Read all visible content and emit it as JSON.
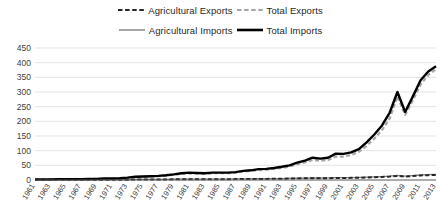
{
  "legend": {
    "rows": [
      [
        {
          "label": "Agricultural Exports",
          "color": "#262626",
          "style": "dashed",
          "width": 2.2,
          "icon": "dashed-line-icon"
        },
        {
          "label": "Total Exports",
          "color": "#a6a6a6",
          "style": "dashed",
          "width": 2.2,
          "icon": "dashed-line-icon"
        }
      ],
      [
        {
          "label": "Agricultural Imports",
          "color": "#808080",
          "style": "solid",
          "width": 1.4,
          "icon": "solid-line-icon"
        },
        {
          "label": "Total Imports",
          "color": "#000000",
          "style": "solid",
          "width": 2.6,
          "icon": "solid-line-icon"
        }
      ]
    ]
  },
  "chart_data": {
    "type": "line",
    "title": "",
    "subtitle": "",
    "xlabel": "",
    "ylabel": "",
    "ylim": [
      0,
      450
    ],
    "ytick_step": 50,
    "yticks": [
      0,
      50,
      100,
      150,
      200,
      250,
      300,
      350,
      400,
      450
    ],
    "ytick_labels": [
      "0",
      "50",
      "100",
      "150",
      "200",
      "250",
      "300",
      "350",
      "400",
      "450"
    ],
    "grid": true,
    "grid_axis": "y",
    "legend_position": "top",
    "x_start": 1961,
    "x_end": 2013,
    "xtick_step": 2,
    "xticks": [
      1961,
      1963,
      1965,
      1967,
      1969,
      1971,
      1973,
      1975,
      1977,
      1979,
      1981,
      1983,
      1985,
      1987,
      1989,
      1991,
      1993,
      1995,
      1997,
      1999,
      2001,
      2003,
      2005,
      2007,
      2009,
      2011,
      2013
    ],
    "xtick_labels": [
      "1961",
      "1963",
      "1965",
      "1967",
      "1969",
      "1971",
      "1973",
      "1975",
      "1977",
      "1979",
      "1981",
      "1983",
      "1985",
      "1987",
      "1989",
      "1991",
      "1993",
      "1995",
      "1997",
      "1999",
      "2001",
      "2003",
      "2005",
      "2007",
      "2009",
      "2011",
      "2013"
    ],
    "x": [
      1961,
      1962,
      1963,
      1964,
      1965,
      1966,
      1967,
      1968,
      1969,
      1970,
      1971,
      1972,
      1973,
      1974,
      1975,
      1976,
      1977,
      1978,
      1979,
      1980,
      1981,
      1982,
      1983,
      1984,
      1985,
      1986,
      1987,
      1988,
      1989,
      1990,
      1991,
      1992,
      1993,
      1994,
      1995,
      1996,
      1997,
      1998,
      1999,
      2000,
      2001,
      2002,
      2003,
      2004,
      2005,
      2006,
      2007,
      2008,
      2009,
      2010,
      2011,
      2012,
      2013
    ],
    "series": [
      {
        "name": "Total Imports",
        "color": "#000000",
        "style": "solid",
        "width": 2.4,
        "values": [
          2,
          2,
          2,
          3,
          3,
          3,
          3,
          4,
          4,
          5,
          5,
          6,
          8,
          11,
          12,
          13,
          14,
          16,
          19,
          23,
          25,
          24,
          23,
          25,
          25,
          25,
          27,
          31,
          33,
          37,
          38,
          41,
          45,
          50,
          59,
          66,
          76,
          73,
          76,
          90,
          89,
          94,
          105,
          128,
          155,
          186,
          230,
          300,
          232,
          285,
          340,
          370,
          388
        ]
      },
      {
        "name": "Total Exports",
        "color": "#a6a6a6",
        "style": "dashed",
        "width": 2.2,
        "values": [
          2,
          2,
          2,
          2,
          3,
          3,
          3,
          3,
          4,
          4,
          5,
          5,
          7,
          10,
          11,
          12,
          13,
          15,
          18,
          21,
          23,
          22,
          21,
          23,
          23,
          23,
          25,
          29,
          31,
          34,
          35,
          38,
          41,
          46,
          54,
          60,
          68,
          66,
          68,
          80,
          80,
          85,
          96,
          116,
          141,
          170,
          210,
          285,
          222,
          272,
          325,
          358,
          378
        ]
      },
      {
        "name": "Agricultural Imports",
        "color": "#808080",
        "style": "solid",
        "width": 1.3,
        "values": [
          0.5,
          0.5,
          0.6,
          0.6,
          0.7,
          0.7,
          0.8,
          0.8,
          0.9,
          1.0,
          1.1,
          1.2,
          1.5,
          1.8,
          1.9,
          2.0,
          2.2,
          2.4,
          2.7,
          3.0,
          3.2,
          3.1,
          3.0,
          3.2,
          3.2,
          3.3,
          3.5,
          3.8,
          4.0,
          4.3,
          4.4,
          4.7,
          5.0,
          5.4,
          6.0,
          6.5,
          7.0,
          6.8,
          7.0,
          7.8,
          7.9,
          8.2,
          8.8,
          9.6,
          10.5,
          11.6,
          13.0,
          15.5,
          13.0,
          15.0,
          17.0,
          18.0,
          19.0
        ]
      },
      {
        "name": "Agricultural Exports",
        "color": "#262626",
        "style": "dashed",
        "width": 2.0,
        "values": [
          0.4,
          0.4,
          0.5,
          0.5,
          0.6,
          0.6,
          0.6,
          0.7,
          0.7,
          0.8,
          0.9,
          1.0,
          1.2,
          1.5,
          1.6,
          1.7,
          1.8,
          2.0,
          2.3,
          2.6,
          2.8,
          2.7,
          2.6,
          2.8,
          2.8,
          2.9,
          3.0,
          3.3,
          3.5,
          3.7,
          3.8,
          4.1,
          4.4,
          4.8,
          5.3,
          5.8,
          6.2,
          6.0,
          6.2,
          7.0,
          7.0,
          7.3,
          7.8,
          8.6,
          9.5,
          10.5,
          11.8,
          14.0,
          11.8,
          13.5,
          15.5,
          16.5,
          17.5
        ]
      }
    ]
  }
}
